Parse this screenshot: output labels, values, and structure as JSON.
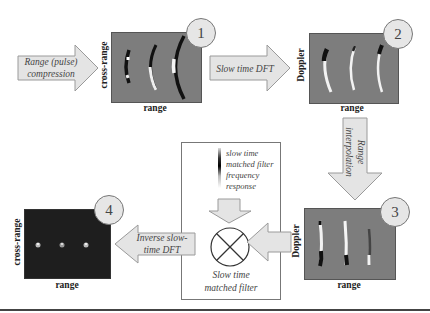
{
  "diagram": {
    "steps": [
      {
        "number": "1",
        "x_label": "range",
        "y_label": "cross-range",
        "description": "Range-compressed data showing curved target migration"
      },
      {
        "number": "2",
        "x_label": "range",
        "y_label": "Doppler",
        "description": "Range-Doppler data after slow time DFT"
      },
      {
        "number": "3",
        "x_label": "range",
        "y_label": "Doppler",
        "description": "Range-interpolated data, straightened target loci"
      },
      {
        "number": "4",
        "x_label": "range",
        "y_label": "cross-range",
        "description": "Focused image with three point targets"
      }
    ],
    "arrows": {
      "range_compression": "Range (pulse) compression",
      "range_compression_l1": "Range (pulse)",
      "range_compression_l2": "compression",
      "slow_time_dft": "Slow time DFT",
      "range_interpolation_l1": "Range",
      "range_interpolation_l2": "interpolation",
      "inverse_dft_l1": "Inverse slow-",
      "inverse_dft_l2": "time DFT"
    },
    "filter_box": {
      "legend_l1": "slow time",
      "legend_l2": "matched filter",
      "legend_l3": "frequency",
      "legend_l4": "response",
      "caption_l1": "Slow time",
      "caption_l2": "matched filter",
      "multiplier_symbol": "multiply-icon"
    }
  },
  "colors": {
    "panel_gray": "#7d7d7d",
    "panel_dark": "#1e1e1e",
    "arrow_fill": "#e4e4e4",
    "arrow_stroke": "#9a9a9a",
    "badge_fill": "#e6e6e6"
  }
}
